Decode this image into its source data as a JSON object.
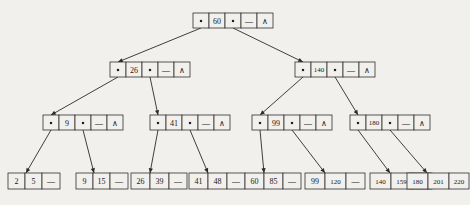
{
  "diagram": {
    "background_color": "#f2f0ec",
    "line_color": "#2a2a2a",
    "text_color": "#181818",
    "null_glyph": "—",
    "terminator_glyph": "∧",
    "pointer_glyph": "▪"
  },
  "levels": [
    {
      "name": "root",
      "nodes": [
        {
          "id": "root",
          "x": 193,
          "y": 13,
          "w": 80,
          "h": 15,
          "cells": [
            {
              "kind": "pointer",
              "label": "▪",
              "w": 16
            },
            {
              "kind": "key",
              "label": "60",
              "w": 16
            },
            {
              "kind": "pointer",
              "label": "▪",
              "w": 16
            },
            {
              "kind": "null",
              "label": "—",
              "w": 16
            },
            {
              "kind": "end",
              "label": "∧",
              "w": 16
            }
          ]
        }
      ]
    },
    {
      "name": "internal-level-1",
      "nodes": [
        {
          "id": "internal-26",
          "x": 110,
          "y": 62,
          "w": 80,
          "h": 15,
          "cells": [
            {
              "kind": "pointer",
              "label": "▪",
              "w": 16
            },
            {
              "kind": "key",
              "label": "26",
              "w": 16
            },
            {
              "kind": "pointer",
              "label": "▪",
              "w": 16
            },
            {
              "kind": "null",
              "label": "—",
              "w": 16
            },
            {
              "kind": "end",
              "label": "∧",
              "w": 16
            }
          ]
        },
        {
          "id": "internal-140",
          "x": 295,
          "y": 62,
          "w": 80,
          "h": 15,
          "cells": [
            {
              "kind": "pointer",
              "label": "▪",
              "w": 16
            },
            {
              "kind": "key",
              "label": "140",
              "w": 16
            },
            {
              "kind": "pointer",
              "label": "▪",
              "w": 16
            },
            {
              "kind": "null",
              "label": "—",
              "w": 16
            },
            {
              "kind": "end",
              "label": "∧",
              "w": 16
            }
          ]
        }
      ]
    },
    {
      "name": "internal-level-2",
      "nodes": [
        {
          "id": "internal-9",
          "x": 43,
          "y": 115,
          "w": 80,
          "h": 15,
          "cells": [
            {
              "kind": "pointer",
              "label": "▪",
              "w": 16
            },
            {
              "kind": "key",
              "label": "9",
              "w": 16
            },
            {
              "kind": "pointer",
              "label": "▪",
              "w": 16
            },
            {
              "kind": "null",
              "label": "—",
              "w": 16
            },
            {
              "kind": "end",
              "label": "∧",
              "w": 16
            }
          ]
        },
        {
          "id": "internal-41",
          "x": 150,
          "y": 115,
          "w": 80,
          "h": 15,
          "cells": [
            {
              "kind": "pointer",
              "label": "▪",
              "w": 16
            },
            {
              "kind": "key",
              "label": "41",
              "w": 16
            },
            {
              "kind": "pointer",
              "label": "▪",
              "w": 16
            },
            {
              "kind": "null",
              "label": "—",
              "w": 16
            },
            {
              "kind": "end",
              "label": "∧",
              "w": 16
            }
          ]
        },
        {
          "id": "internal-99",
          "x": 252,
          "y": 115,
          "w": 80,
          "h": 15,
          "cells": [
            {
              "kind": "pointer",
              "label": "▪",
              "w": 16
            },
            {
              "kind": "key",
              "label": "99",
              "w": 16
            },
            {
              "kind": "pointer",
              "label": "▪",
              "w": 16
            },
            {
              "kind": "null",
              "label": "—",
              "w": 16
            },
            {
              "kind": "end",
              "label": "∧",
              "w": 16
            }
          ]
        },
        {
          "id": "internal-180",
          "x": 350,
          "y": 115,
          "w": 80,
          "h": 15,
          "cells": [
            {
              "kind": "pointer",
              "label": "▪",
              "w": 16
            },
            {
              "kind": "key",
              "label": "180",
              "w": 16
            },
            {
              "kind": "pointer",
              "label": "▪",
              "w": 16
            },
            {
              "kind": "null",
              "label": "—",
              "w": 16
            },
            {
              "kind": "end",
              "label": "∧",
              "w": 16
            }
          ]
        }
      ]
    },
    {
      "name": "leaves",
      "nodes": [
        {
          "id": "leaf-1",
          "x": 8,
          "y": 173,
          "w": 52,
          "h": 16,
          "cells": [
            {
              "kind": "key",
              "label": "2",
              "w": 17
            },
            {
              "kind": "key",
              "label": "5",
              "w": 17
            },
            {
              "kind": "null",
              "label": "—",
              "w": 18
            }
          ]
        },
        {
          "id": "leaf-2",
          "x": 76,
          "y": 173,
          "w": 52,
          "h": 16,
          "cells": [
            {
              "kind": "key",
              "label": "9",
              "w": 17
            },
            {
              "kind": "key",
              "label": "15",
              "w": 17
            },
            {
              "kind": "null",
              "label": "—",
              "w": 18
            }
          ]
        },
        {
          "id": "leaf-3",
          "x": 131,
          "y": 173,
          "w": 56,
          "h": 16,
          "cells": [
            {
              "kind": "key",
              "label": "26",
              "w": 19
            },
            {
              "kind": "key",
              "label": "39",
              "w": 19
            },
            {
              "kind": "null",
              "label": "—",
              "w": 18
            }
          ]
        },
        {
          "id": "leaf-4",
          "x": 189,
          "y": 173,
          "w": 56,
          "h": 16,
          "cells": [
            {
              "kind": "key",
              "label": "41",
              "w": 19
            },
            {
              "kind": "key",
              "label": "48",
              "w": 19
            },
            {
              "kind": "null",
              "label": "—",
              "w": 18
            }
          ]
        },
        {
          "id": "leaf-5",
          "x": 245,
          "y": 173,
          "w": 56,
          "h": 16,
          "cells": [
            {
              "kind": "key",
              "label": "60",
              "w": 19
            },
            {
              "kind": "key",
              "label": "85",
              "w": 19
            },
            {
              "kind": "null",
              "label": "—",
              "w": 18
            }
          ]
        },
        {
          "id": "leaf-6",
          "x": 305,
          "y": 173,
          "w": 60,
          "h": 16,
          "cells": [
            {
              "kind": "key",
              "label": "99",
              "w": 20
            },
            {
              "kind": "key",
              "label": "120",
              "w": 21
            },
            {
              "kind": "null",
              "label": "—",
              "w": 19
            }
          ]
        },
        {
          "id": "leaf-7",
          "x": 370,
          "y": 173,
          "w": 62,
          "h": 16,
          "cells": [
            {
              "kind": "key",
              "label": "140",
              "w": 21
            },
            {
              "kind": "key",
              "label": "159",
              "w": 21
            },
            {
              "kind": "null",
              "label": "—",
              "w": 20
            }
          ]
        },
        {
          "id": "leaf-8",
          "x": 407,
          "y": 173,
          "w": 62,
          "h": 16,
          "cells": [
            {
              "kind": "key",
              "label": "180",
              "w": 21
            },
            {
              "kind": "key",
              "label": "201",
              "w": 21
            },
            {
              "kind": "key",
              "label": "220",
              "w": 20
            }
          ]
        }
      ]
    }
  ],
  "edges": [
    {
      "from": "root",
      "from_slot": 0,
      "to": "internal-26",
      "to_x": 118,
      "to_y": 62
    },
    {
      "from": "root",
      "from_slot": 2,
      "to": "internal-140",
      "to_x": 303,
      "to_y": 62
    },
    {
      "from": "internal-26",
      "from_slot": 0,
      "to": "internal-9",
      "to_x": 51,
      "to_y": 115
    },
    {
      "from": "internal-26",
      "from_slot": 2,
      "to": "internal-41",
      "to_x": 158,
      "to_y": 115
    },
    {
      "from": "internal-140",
      "from_slot": 0,
      "to": "internal-99",
      "to_x": 260,
      "to_y": 115
    },
    {
      "from": "internal-140",
      "from_slot": 2,
      "to": "internal-180",
      "to_x": 358,
      "to_y": 115
    },
    {
      "from": "internal-9",
      "from_slot": 0,
      "to": "leaf-1",
      "to_x": 26,
      "to_y": 173
    },
    {
      "from": "internal-9",
      "from_slot": 2,
      "to": "leaf-2",
      "to_x": 94,
      "to_y": 173
    },
    {
      "from": "internal-41",
      "from_slot": 0,
      "to": "leaf-3",
      "to_x": 150,
      "to_y": 173
    },
    {
      "from": "internal-41",
      "from_slot": 2,
      "to": "leaf-4",
      "to_x": 208,
      "to_y": 173
    },
    {
      "from": "internal-99",
      "from_slot": 0,
      "to": "leaf-5",
      "to_x": 264,
      "to_y": 173
    },
    {
      "from": "internal-99",
      "from_slot": 2,
      "to": "leaf-6",
      "to_x": 325,
      "to_y": 173
    },
    {
      "from": "internal-180",
      "from_slot": 0,
      "to": "leaf-7",
      "to_x": 390,
      "to_y": 173
    },
    {
      "from": "internal-180",
      "from_slot": 2,
      "to": "leaf-8",
      "to_x": 427,
      "to_y": 173
    }
  ]
}
